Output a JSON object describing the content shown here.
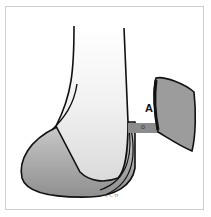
{
  "figure": {
    "type": "anatomical-illustration",
    "labels": {
      "point_a": "A",
      "connector": "o"
    },
    "signature": "ᄔᄂᄆ",
    "colors": {
      "background": "#ffffff",
      "border": "#cfcfcf",
      "outline": "#111111",
      "fill_gray": "#9c9c9c",
      "fill_light": "#e8e8e8",
      "connector": "#8c8c8c"
    }
  }
}
